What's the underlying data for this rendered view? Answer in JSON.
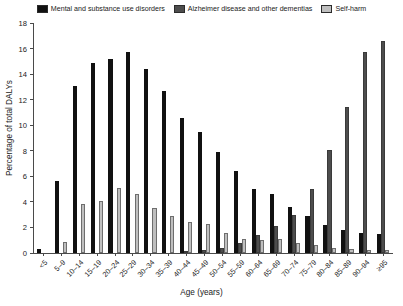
{
  "chart_data": {
    "type": "bar",
    "title": "",
    "xlabel": "Age (years)",
    "ylabel": "Percentage of total DALYs",
    "ylim": [
      0,
      18
    ],
    "yticks": [
      0,
      2,
      4,
      6,
      8,
      10,
      12,
      14,
      16,
      18
    ],
    "grid": false,
    "legend_position": "top-center",
    "categories": [
      "<5",
      "5–9",
      "10–14",
      "15–19",
      "20–24",
      "25–29",
      "30–34",
      "35–39",
      "40–44",
      "45–49",
      "50–54",
      "55–59",
      "60–64",
      "65–69",
      "70–74",
      "75–79",
      "80–84",
      "85–89",
      "90–94",
      "≥95"
    ],
    "series": [
      {
        "name": "Mental and substance use disorders",
        "color": "#111111",
        "values": [
          0.3,
          5.6,
          13.1,
          14.9,
          15.2,
          15.7,
          14.4,
          12.7,
          10.6,
          9.5,
          7.9,
          6.4,
          5.0,
          4.6,
          3.6,
          2.9,
          2.2,
          1.8,
          1.6,
          1.5
        ]
      },
      {
        "name": "Alzheimer disease and other dementias",
        "color": "#4d4d4d",
        "values": [
          0.0,
          0.0,
          0.0,
          0.0,
          0.0,
          0.0,
          0.0,
          0.0,
          0.1,
          0.2,
          0.4,
          0.8,
          1.4,
          2.1,
          3.0,
          5.0,
          8.1,
          11.4,
          15.7,
          16.6
        ]
      },
      {
        "name": "Self-harm",
        "color": "#bfbfbf",
        "values": [
          0.0,
          0.9,
          3.8,
          4.1,
          5.1,
          4.6,
          3.5,
          2.9,
          2.4,
          2.3,
          1.6,
          1.1,
          1.0,
          1.1,
          0.8,
          0.6,
          0.4,
          0.3,
          0.2,
          0.2
        ]
      }
    ]
  },
  "legend": {
    "items": [
      {
        "label": "Mental and substance use disorders",
        "swatch": "#111111"
      },
      {
        "label": "Alzheimer disease and other dementias",
        "swatch": "#4d4d4d"
      },
      {
        "label": "Self-harm",
        "swatch": "#bfbfbf"
      }
    ]
  }
}
